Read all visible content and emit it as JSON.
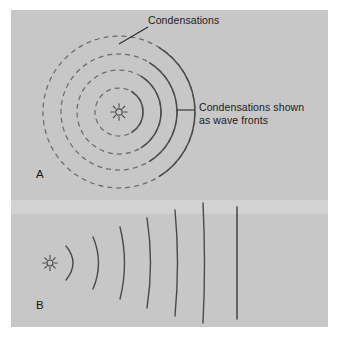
{
  "figure": {
    "title_alt": "Sound wave condensations radiating from a point source",
    "width": 339,
    "height": 339,
    "background": "#ffffff",
    "plate_color": "#c9c9c9",
    "ink_color": "#4a4a4a",
    "text_color": "#1b1b1b"
  },
  "labels": {
    "condensations": "Condensations",
    "wavefronts_line1": "Condensations shown",
    "wavefronts_line2": "as wave fronts"
  },
  "panels": [
    {
      "letter": "A",
      "caption": "A",
      "description": "Point source emitting concentric spherical condensations; right half of each condensation is drawn solid as a wave front.",
      "source": {
        "type": "point-source-starburst",
        "cx": 119,
        "cy": 112,
        "ray_count": 8,
        "ray_length": 9,
        "core_radius": 3.2
      },
      "rings": [
        {
          "index": 1,
          "radius": 24
        },
        {
          "index": 2,
          "radius": 42
        },
        {
          "index": 3,
          "radius": 58
        },
        {
          "index": 4,
          "radius": 76
        }
      ],
      "ring_style": {
        "stroke": "#6b6b6b",
        "dash": "5 4",
        "width": 1.25
      },
      "wavefront_style": {
        "stroke": "#4a4a4a",
        "width": 1.5,
        "arc_start_deg": -58,
        "arc_end_deg": 58
      },
      "leaders": [
        {
          "name": "condensations-leader",
          "x1": 148,
          "y1": 27,
          "x2": 119,
          "y2": 44
        },
        {
          "name": "wavefronts-leader",
          "x1": 195,
          "y1": 110,
          "x2": 177,
          "y2": 110
        }
      ]
    },
    {
      "letter": "B",
      "caption": "B",
      "description": "Same wave fronts shown in profile; arcs flatten with distance until the far field becomes a straight plane wave.",
      "source": {
        "type": "point-source-starburst",
        "cx": 50,
        "cy": 263,
        "ray_count": 8,
        "ray_length": 8,
        "core_radius": 3.0
      },
      "wavefronts": [
        {
          "index": 1,
          "x": 66,
          "half_height": 17,
          "bulge": 14
        },
        {
          "index": 2,
          "x": 93,
          "half_height": 26,
          "bulge": 11
        },
        {
          "index": 3,
          "x": 120,
          "half_height": 36,
          "bulge": 9
        },
        {
          "index": 4,
          "x": 147,
          "half_height": 45,
          "bulge": 7
        },
        {
          "index": 5,
          "x": 175,
          "half_height": 53,
          "bulge": 5
        },
        {
          "index": 6,
          "x": 203,
          "half_height": 60,
          "bulge": 3
        }
      ],
      "plane_wave": {
        "x": 237,
        "y_top": 207,
        "y_bottom": 319,
        "stroke": "#3c3c3c",
        "width": 1.4
      },
      "wavefront_style": {
        "stroke": "#4a4a4a",
        "width": 1.4
      }
    }
  ]
}
